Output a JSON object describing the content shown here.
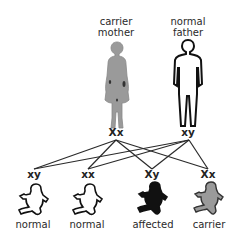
{
  "parents": [
    {
      "id": "mother",
      "label_line1": "carrier",
      "label_line2": "mother",
      "genotype": "Xx",
      "status": "carrier",
      "fill": "#9a9a9a"
    },
    {
      "id": "father",
      "label_line1": "normal",
      "label_line2": "father",
      "genotype": "xy",
      "status": "normal",
      "fill": "#ffffff"
    }
  ],
  "children": [
    {
      "genotype": "xy",
      "label": "normal",
      "status": "normal",
      "fill": "#ffffff"
    },
    {
      "genotype": "xx",
      "label": "normal",
      "status": "normal",
      "fill": "#ffffff"
    },
    {
      "genotype": "Xy",
      "label": "affected",
      "status": "affected",
      "fill": "#111111"
    },
    {
      "genotype": "Xx",
      "label": "carrier",
      "status": "carrier",
      "fill": "#9a9a9a"
    }
  ],
  "colors": {
    "line": "#2a2a2a",
    "carrier": "#9a9a9a",
    "affected": "#111111",
    "normal": "#ffffff"
  }
}
